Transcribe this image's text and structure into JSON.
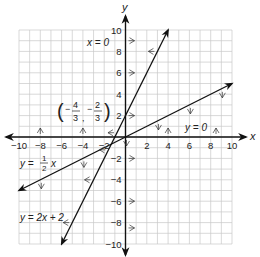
{
  "chart_data": {
    "type": "line",
    "title": "",
    "xlabel": "x",
    "ylabel": "y",
    "xlim": [
      -10,
      10
    ],
    "ylim": [
      -10,
      10
    ],
    "grid": true,
    "x_ticks": [
      -10,
      -8,
      -6,
      -4,
      -2,
      2,
      4,
      6,
      8,
      10
    ],
    "y_ticks": [
      10,
      8,
      6,
      4,
      2,
      -2,
      -4,
      -6,
      -8,
      -10
    ],
    "series": [
      {
        "name": "y = 2x + 2",
        "equation": "y = 2x + 2",
        "points": [
          [
            -6,
            -10
          ],
          [
            4,
            10
          ]
        ],
        "shading_arrows": "toward left"
      },
      {
        "name": "y = 1/2 x",
        "equation": "y = (1/2)x",
        "points": [
          [
            -10,
            -5
          ],
          [
            10,
            5
          ]
        ],
        "shading_arrows": "below"
      },
      {
        "name": "x = 0",
        "equation": "x = 0",
        "points": [
          [
            0,
            -10
          ],
          [
            0,
            10
          ]
        ],
        "shading_arrows": "right"
      },
      {
        "name": "y = 0",
        "equation": "y = 0",
        "points": [
          [
            -10,
            0
          ],
          [
            10,
            0
          ]
        ],
        "shading_arrows": "above"
      }
    ],
    "annotations": [
      {
        "text": "(-4/3, -2/3)",
        "x": -4.667,
        "y": 1.0,
        "marks_point": [
          -1.333,
          -0.667
        ]
      },
      {
        "text": "x = 0",
        "x": -2.3,
        "y": 9
      },
      {
        "text": "y = 0",
        "x": 6.5,
        "y": 0.8
      },
      {
        "text": "y = 1/2 x",
        "x": -9.5,
        "y": -3.2
      },
      {
        "text": "y = 2x + 2",
        "x": -9.5,
        "y": -7.8
      }
    ]
  },
  "labels": {
    "x_axis": "x",
    "y_axis": "y",
    "eq_x0": "x = 0",
    "eq_y0": "y = 0",
    "eq_half_prefix": "y = ",
    "eq_half_num": "1",
    "eq_half_den": "2",
    "eq_half_suffix": "x",
    "eq_line": "y = 2x + 2",
    "point_x_num": "4",
    "point_x_den": "3",
    "point_y_num": "2",
    "point_y_den": "3"
  }
}
